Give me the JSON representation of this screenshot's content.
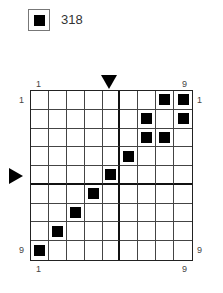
{
  "legend": {
    "label": "318",
    "swatch_color": "#000000"
  },
  "grid": {
    "rows": 9,
    "cols": 9,
    "thick_after_col": 5,
    "thick_after_row": 5,
    "filled_cells": [
      [
        1,
        8
      ],
      [
        1,
        9
      ],
      [
        2,
        7
      ],
      [
        2,
        9
      ],
      [
        3,
        7
      ],
      [
        3,
        8
      ],
      [
        4,
        6
      ],
      [
        5,
        5
      ],
      [
        6,
        4
      ],
      [
        7,
        3
      ],
      [
        8,
        2
      ],
      [
        9,
        1
      ]
    ]
  },
  "labels": {
    "top_left": "1",
    "top_right": "9",
    "bottom_left": "1",
    "bottom_right": "9",
    "left_top": "1",
    "left_bottom": "9",
    "right_top": "1",
    "right_bottom": "9"
  },
  "markers": {
    "top_arrow_col": 5,
    "left_arrow_row": 5
  }
}
